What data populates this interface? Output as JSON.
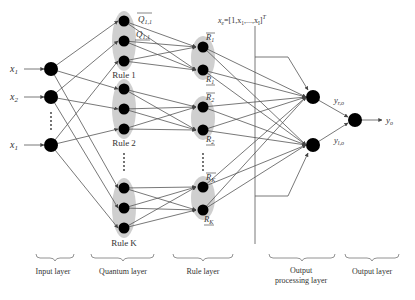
{
  "inputs": {
    "labels": [
      "x1",
      "x2",
      "xI"
    ],
    "label_display": [
      "x₁",
      "x₂",
      "x₁"
    ],
    "ellipsis": "⋮"
  },
  "quantum_layer": {
    "rules": [
      {
        "label": "Rule 1"
      },
      {
        "label": "Rule 2"
      },
      {
        "label": "Rule K"
      }
    ],
    "top_labels": {
      "upper": "Q̄₁₁",
      "lower": "Q₁₁"
    },
    "top_label_main": "Q",
    "top_label_sub": "1,1"
  },
  "rule_layer": {
    "groups": [
      {
        "upper": "R̄",
        "upper_sub": "1",
        "lower": "R",
        "lower_sub": "1"
      },
      {
        "upper": "R̄",
        "upper_sub": "2",
        "lower": "R",
        "lower_sub": "2"
      },
      {
        "upper": "R̄",
        "upper_sub": "K",
        "lower": "R",
        "lower_sub": "K"
      }
    ]
  },
  "extended_input": {
    "label_main": "x",
    "label_sub": "e",
    "label_rest": "=[1,x",
    "label_rest_sub": "1",
    "label_tail": ",...,x",
    "label_tail_sub": "I",
    "label_close": "]",
    "label_sup": "T"
  },
  "output_processing": {
    "y_r": {
      "main": "y",
      "sub": "r,o"
    },
    "y_l": {
      "main": "y",
      "sub": "l,o"
    }
  },
  "output": {
    "main": "y",
    "sub": "o"
  },
  "layers": [
    {
      "label": "Input layer"
    },
    {
      "label": "Quantum layer"
    },
    {
      "label": "Rule layer"
    },
    {
      "label_line1": "Output",
      "label_line2": "processing layer"
    },
    {
      "label": "Output layer"
    }
  ],
  "colors": {
    "node": "#000000",
    "group_fill": "#cfcfcf",
    "edge": "#555555",
    "text": "#333333"
  }
}
